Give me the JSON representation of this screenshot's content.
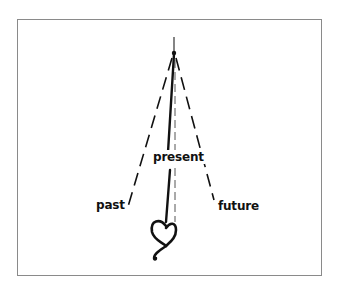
{
  "diagram": {
    "labels": {
      "present": "present",
      "past": "past",
      "future": "future"
    },
    "colors": {
      "stroke": "#111111",
      "border": "#8a8a8a",
      "background": "#ffffff"
    }
  }
}
